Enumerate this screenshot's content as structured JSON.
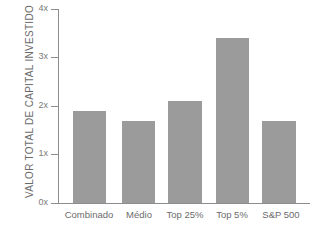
{
  "chart_data": {
    "type": "bar",
    "title": "",
    "xlabel": "",
    "ylabel": "VALOR TOTAL DE CAPITAL INVESTIDO",
    "categories": [
      "Combinado",
      "Médio",
      "Top 25%",
      "Top 5%",
      "S&P 500"
    ],
    "values": [
      1.9,
      1.7,
      2.1,
      3.4,
      1.7
    ],
    "ylim": [
      0,
      4
    ],
    "ytick_labels": [
      "0x",
      "1x",
      "2x",
      "3x",
      "4x"
    ],
    "ytick_values": [
      0,
      1,
      2,
      3,
      4
    ],
    "grid": false,
    "legend": null,
    "bar_color": "#9b9b9b",
    "axis_color": "#8d8d8d",
    "text_color": "#6b6b6b",
    "background": "#ffffff"
  }
}
